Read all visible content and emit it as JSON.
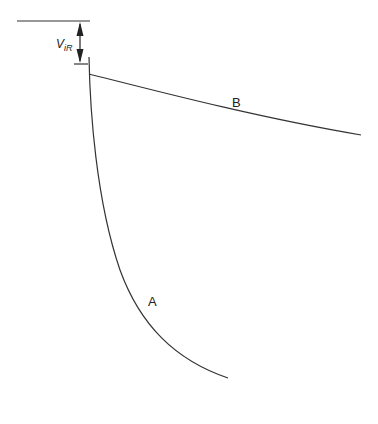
{
  "diagram": {
    "dimension_label": {
      "main": "V",
      "subscript": "iR"
    },
    "curves": [
      {
        "id": "A",
        "label": "A"
      },
      {
        "id": "B",
        "label": "B"
      }
    ],
    "colors": {
      "stroke": "#333333",
      "text": "#222222"
    }
  }
}
